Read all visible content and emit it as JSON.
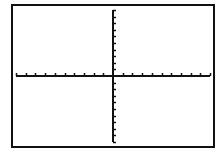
{
  "chart_data": {
    "type": "line",
    "title": "",
    "xlabel": "",
    "ylabel": "",
    "xlim": [
      -10,
      10
    ],
    "ylim": [
      -10,
      10
    ],
    "xscl": 1,
    "yscl": 1,
    "grid": false,
    "legend": null,
    "series": [],
    "axes": {
      "x_axis_visible": true,
      "y_axis_visible": true,
      "x_tick_direction": "up",
      "y_tick_direction": "right",
      "tick_count_per_half": 10
    }
  },
  "colors": {
    "background": "#ffffff",
    "axis": "#111111",
    "border": "#111111"
  }
}
